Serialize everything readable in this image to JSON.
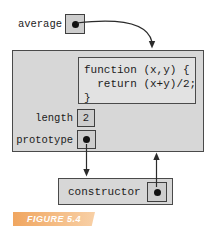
{
  "diagram": {
    "variable": {
      "label": "average"
    },
    "function_object": {
      "code_lines": {
        "0": "function (x,y) {",
        "1": "  return (x+y)/2;",
        "2": "}"
      },
      "properties": {
        "length": {
          "name": "length",
          "value": "2"
        },
        "prototype": {
          "name": "prototype"
        }
      }
    },
    "constructor_object": {
      "label": "constructor"
    },
    "caption": "FIGURE 5.4",
    "colors": {
      "object_fill": "#d7d7d7",
      "code_fill": "#e2e2e2",
      "slot_fill": "#cdcdcd",
      "border": "#4a4a4a",
      "pointer_dot": "#111111",
      "arrow": "#2b2b2b",
      "caption_bg": "#f0a660",
      "caption_text": "#ffffff"
    }
  }
}
